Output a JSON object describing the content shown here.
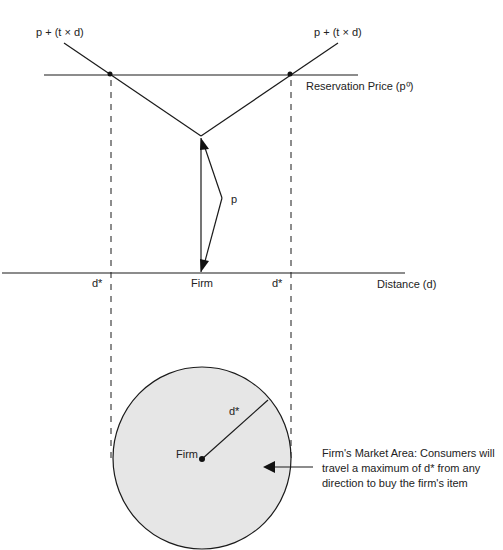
{
  "diagram": {
    "labels": {
      "curve_left": "p + (t × d)",
      "curve_right": "p + (t × d)",
      "reservation_price": "Reservation Price (p⁰)",
      "price_p": "p",
      "firm_axis": "Firm",
      "dstar_left": "d*",
      "dstar_right": "d*",
      "distance_axis": "Distance (d)",
      "radius_label": "d*",
      "firm_center": "Firm",
      "market_area_line1": "Firm's Market Area: Consumers will",
      "market_area_line2": "travel a maximum of d* from any",
      "market_area_line3": "direction to buy the firm's item"
    },
    "colors": {
      "line": "#1a1a1a",
      "circle_fill": "#e6e6e6",
      "background": "#ffffff"
    }
  }
}
